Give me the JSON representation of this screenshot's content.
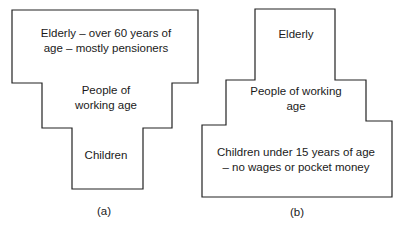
{
  "figures": [
    {
      "caption": "(a)",
      "regions": {
        "elderly": {
          "line1": "Elderly – over 60 years of",
          "line2": "age – mostly pensioners"
        },
        "working": {
          "line1": "People of",
          "line2": "working age"
        },
        "children": {
          "line1": "Children"
        }
      }
    },
    {
      "caption": "(b)",
      "regions": {
        "elderly": {
          "line1": "Elderly"
        },
        "working": {
          "line1": "People of working",
          "line2": "age"
        },
        "children": {
          "line1": "Children under 15 years of age",
          "line2": "– no wages or pocket money"
        }
      }
    }
  ],
  "colors": {
    "stroke": "#222222",
    "background": "#ffffff"
  }
}
